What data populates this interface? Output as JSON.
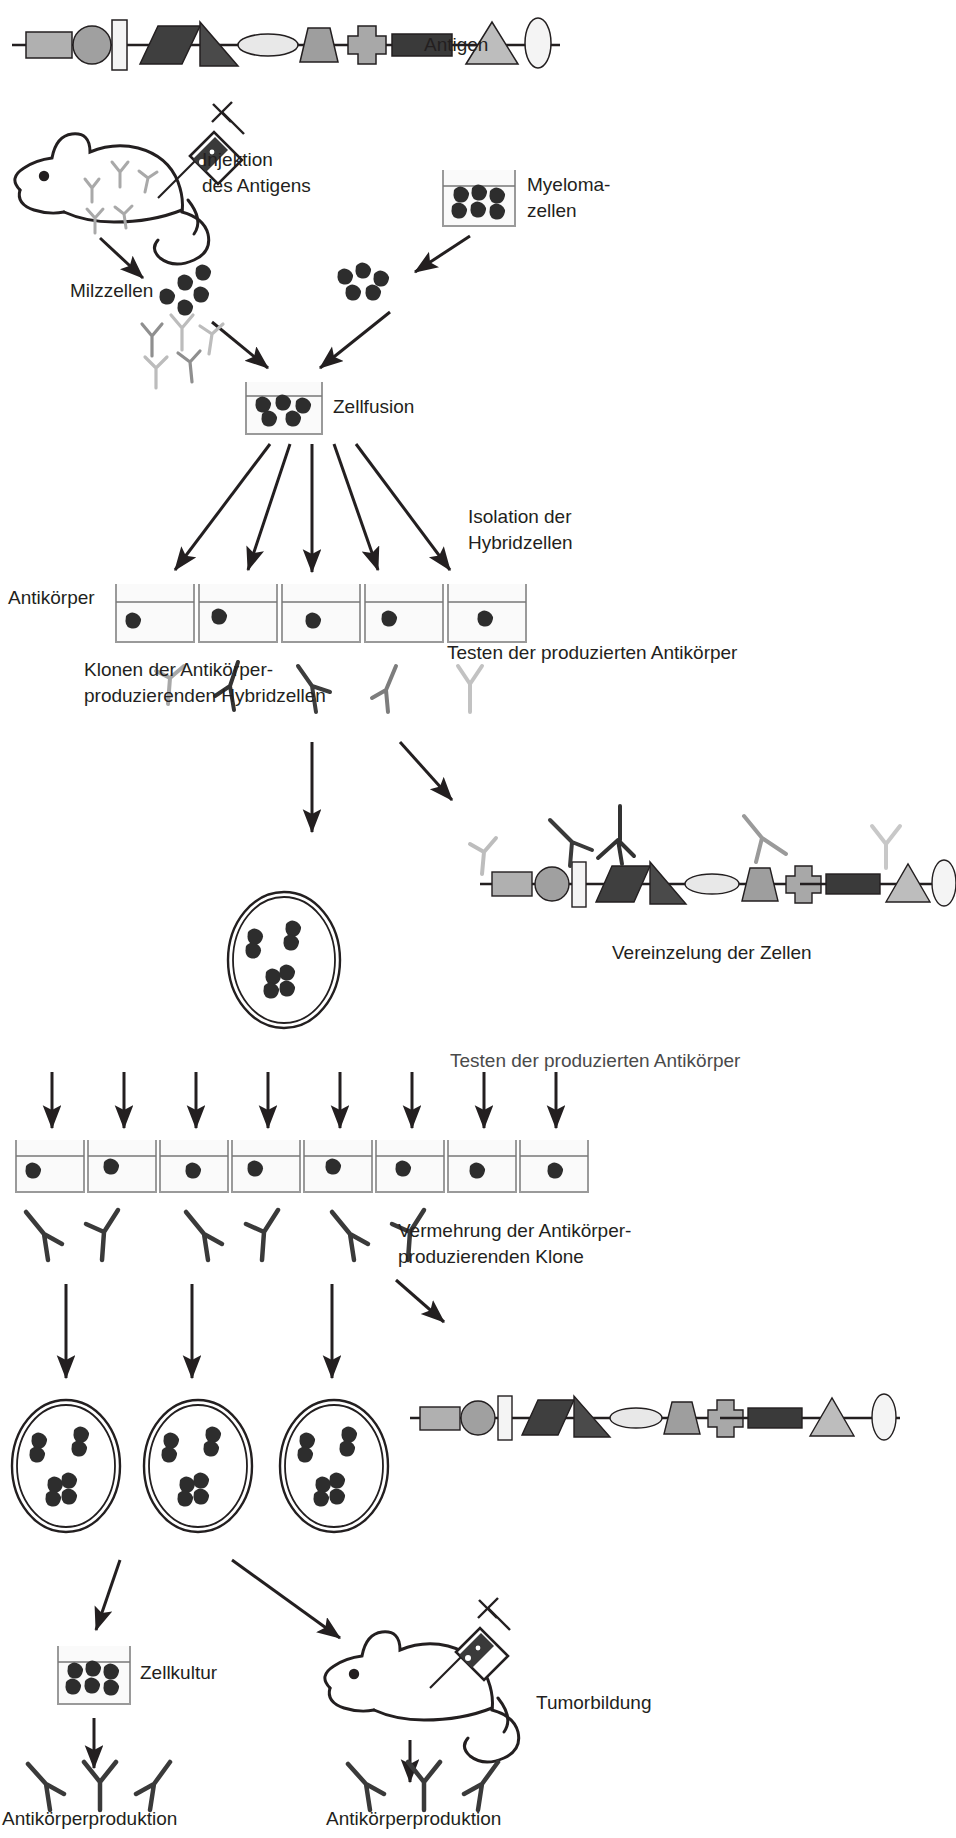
{
  "figure": {
    "title_text": "Hybridoma technology / monoclonal antibody production (German)",
    "background": "#ffffff",
    "ink": "#231f20"
  },
  "labels": {
    "antigen": "Antigen",
    "injektion_line1": "Injektion",
    "injektion_line2": "des Antigens",
    "myeloma_line1": "Myeloma-",
    "myeloma_line2": "zellen",
    "milzzellen": "Milzzellen",
    "zellfusion": "Zellfusion",
    "isolation_line1": "Isolation der",
    "isolation_line2": "Hybridzellen",
    "antikoerper": "Antikörper",
    "klonen_line1": "Klonen der Antikörper-",
    "klonen_line2": "produzierenden Hybridzellen",
    "testen_1": "Testen der produzierten Antikörper",
    "vereinzelung": "Vereinzelung der Zellen",
    "testen_2": "Testen der produzierten Antikörper",
    "vermehrung_line1": "Vermehrung der Antikörper-",
    "vermehrung_line2": "produzierenden Klone",
    "zellkultur": "Zellkultur",
    "tumorbildung": "Tumorbildung",
    "antikoerperproduktion_left": "Antikörperproduktion",
    "antikoerperproduktion_right": "Antikörperproduktion"
  },
  "colors": {
    "ink": "#231f20",
    "cell_dark": "#2b2b2b",
    "cell_mid": "#3a3a3a",
    "flask_outline": "#9a9a9a",
    "flask_fill": "#f2f2f2",
    "ab_light": "#b8b8b8",
    "ab_mid": "#8c8c8c",
    "ab_dark": "#2b2b2b",
    "shape_light": "#c9c9c9",
    "shape_mid": "#a0a0a0",
    "shape_dark": "#4a4a4a",
    "shape_darkest": "#3c3c3c",
    "shape_pale": "#efefef"
  },
  "antigen_chain": {
    "description": "Linear antigen backbone decorated with geometric epitope shapes",
    "shapes": [
      {
        "name": "rectangle-epitope",
        "fill": "#b0b0b0"
      },
      {
        "name": "circle-epitope",
        "fill": "#a0a0a0"
      },
      {
        "name": "tall-bar-epitope",
        "fill": "#f4f4f4"
      },
      {
        "name": "parallelogram-epitope",
        "fill": "#3f3f3f"
      },
      {
        "name": "right-triangle-epitope",
        "fill": "#4a4a4a"
      },
      {
        "name": "ellipse-epitope",
        "fill": "#e8e8e8"
      },
      {
        "name": "trapezoid-epitope",
        "fill": "#9e9e9e"
      },
      {
        "name": "cross-epitope",
        "fill": "#a8a8a8"
      },
      {
        "name": "dark-bar-epitope",
        "fill": "#3a3a3a"
      },
      {
        "name": "triangle-epitope",
        "fill": "#bdbdbd"
      },
      {
        "name": "vertical-ellipse-epitope",
        "fill": "#f4f4f4"
      }
    ]
  },
  "steps": {
    "hybrid_wells_count": 5,
    "single_cell_wells_count": 8,
    "clone_dishes_count": 3,
    "antibody_row_1_count": 5,
    "antibody_row_2_groups": 3,
    "fusion_arrows_count": 5,
    "vereinzelung_arrows_count": 8,
    "final_antibodies_left": 3,
    "final_antibodies_right": 3,
    "myeloma_cells_in_flask": 6,
    "cells_in_culture_flask": 6
  }
}
